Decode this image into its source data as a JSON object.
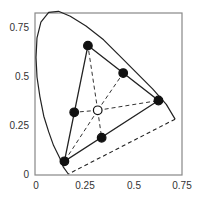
{
  "chart_data": {
    "type": "scatter",
    "title": "",
    "xlabel": "",
    "ylabel": "",
    "xlim": [
      0,
      0.75
    ],
    "ylim": [
      0,
      0.8
    ],
    "grid": false,
    "x_ticks": [
      "0",
      "0.25",
      "0.5",
      "0.75"
    ],
    "y_ticks": [
      "0",
      "0.25",
      "0.5",
      "0.75"
    ],
    "spectral_locus": [
      [
        0.17,
        0.005
      ],
      [
        0.145,
        0.04
      ],
      [
        0.125,
        0.09
      ],
      [
        0.095,
        0.15
      ],
      [
        0.07,
        0.22
      ],
      [
        0.045,
        0.3
      ],
      [
        0.025,
        0.4
      ],
      [
        0.01,
        0.5
      ],
      [
        0.005,
        0.6
      ],
      [
        0.01,
        0.7
      ],
      [
        0.03,
        0.78
      ],
      [
        0.07,
        0.83
      ],
      [
        0.12,
        0.835
      ],
      [
        0.18,
        0.81
      ],
      [
        0.26,
        0.76
      ],
      [
        0.35,
        0.69
      ],
      [
        0.44,
        0.6
      ],
      [
        0.52,
        0.52
      ],
      [
        0.6,
        0.44
      ],
      [
        0.67,
        0.36
      ],
      [
        0.715,
        0.285
      ]
    ],
    "purple_line": [
      [
        0.715,
        0.285
      ],
      [
        0.17,
        0.005
      ]
    ],
    "primaries_triangle": [
      [
        0.27,
        0.66
      ],
      [
        0.63,
        0.38
      ],
      [
        0.15,
        0.07
      ]
    ],
    "points": [
      {
        "name": "green",
        "x": 0.27,
        "y": 0.66,
        "filled": true
      },
      {
        "name": "red",
        "x": 0.63,
        "y": 0.38,
        "filled": true
      },
      {
        "name": "blue",
        "x": 0.15,
        "y": 0.07,
        "filled": true
      },
      {
        "name": "yellow",
        "x": 0.45,
        "y": 0.52,
        "filled": true
      },
      {
        "name": "cyan",
        "x": 0.2,
        "y": 0.32,
        "filled": true
      },
      {
        "name": "magenta",
        "x": 0.34,
        "y": 0.19,
        "filled": true
      },
      {
        "name": "white",
        "x": 0.32,
        "y": 0.33,
        "filled": false
      }
    ],
    "dashed_lines_from_white_to": [
      "green",
      "red",
      "blue",
      "yellow",
      "cyan",
      "magenta"
    ]
  },
  "axes": {
    "x_labels": [
      "0",
      "0.25",
      "0.5",
      "0.75"
    ],
    "y_labels": [
      "0",
      "0.25",
      "0.5",
      "0.75"
    ]
  }
}
